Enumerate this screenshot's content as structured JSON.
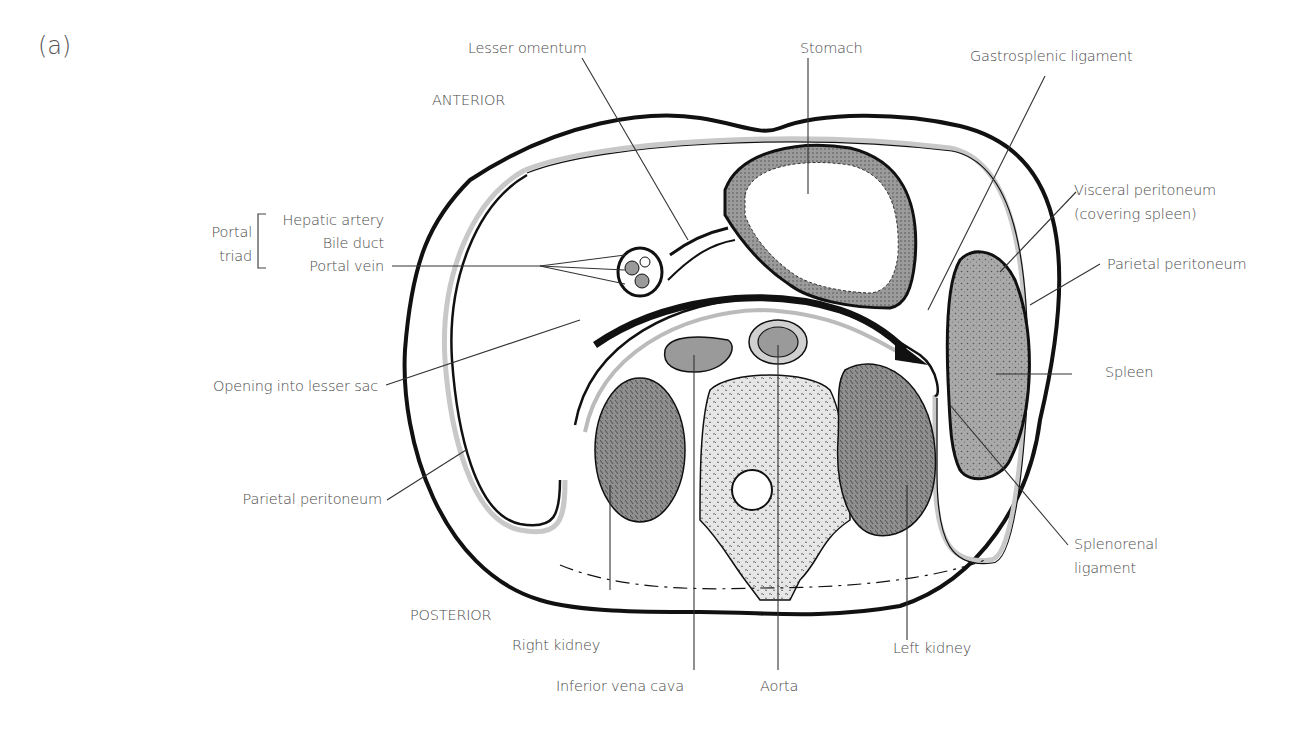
{
  "figure": {
    "panel_label": "(a)",
    "orientation": {
      "anterior": "ANTERIOR",
      "posterior": "POSTERIOR"
    },
    "colors": {
      "outline": "#111111",
      "peritoneum": "#c8c8c8",
      "organ_fill": "#8e8e8e",
      "vessel_fill": "#9a9a9a",
      "label_text": "#4a4a4a"
    }
  },
  "labels": {
    "lesser_omentum": "Lesser omentum",
    "stomach": "Stomach",
    "gastrosplenic_ligament": "Gastrosplenic ligament",
    "visceral_peritoneum_line1": "Visceral peritoneum",
    "visceral_peritoneum_line2": "(covering spleen)",
    "parietal_peritoneum_right": "Parietal peritoneum",
    "spleen": "Spleen",
    "splenorenal_line1": "Splenorenal",
    "splenorenal_line2": "ligament",
    "portal_triad_line1": "Portal",
    "portal_triad_line2": "triad",
    "hepatic_artery": "Hepatic artery",
    "bile_duct": "Bile duct",
    "portal_vein": "Portal vein",
    "opening_lesser_sac": "Opening into lesser sac",
    "parietal_peritoneum_left": "Parietal peritoneum",
    "right_kidney": "Right kidney",
    "inferior_vena_cava": "Inferior vena cava",
    "aorta": "Aorta",
    "left_kidney": "Left kidney"
  }
}
